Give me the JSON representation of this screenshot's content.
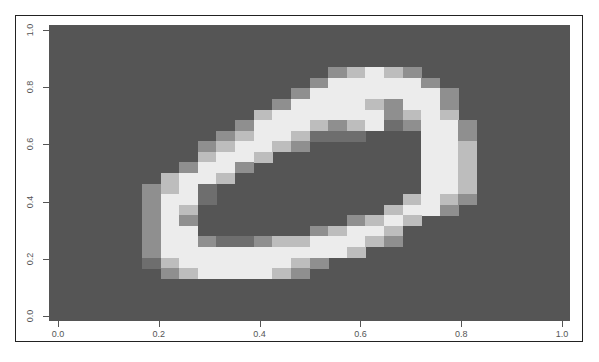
{
  "chart_data": {
    "type": "heatmap",
    "title": "",
    "xlabel": "",
    "ylabel": "",
    "xlim": [
      0,
      1
    ],
    "ylim": [
      0,
      1
    ],
    "x_ticks": [
      "0.0",
      "0.2",
      "0.4",
      "0.6",
      "0.8",
      "1.0"
    ],
    "y_ticks": [
      "0.0",
      "0.2",
      "0.4",
      "0.6",
      "0.8",
      "1.0"
    ],
    "grid": false,
    "legend": null,
    "grid_size": [
      28,
      28
    ],
    "palette": [
      "#555555",
      "#6e6e6e",
      "#8f8f8f",
      "#bdbdbd",
      "#ececec"
    ],
    "cells": [
      [
        4,
        15,
        2
      ],
      [
        4,
        16,
        3
      ],
      [
        4,
        17,
        4
      ],
      [
        4,
        18,
        3
      ],
      [
        4,
        19,
        2
      ],
      [
        5,
        14,
        2
      ],
      [
        5,
        15,
        4
      ],
      [
        5,
        16,
        4
      ],
      [
        5,
        17,
        4
      ],
      [
        5,
        18,
        4
      ],
      [
        5,
        19,
        4
      ],
      [
        5,
        20,
        2
      ],
      [
        6,
        13,
        2
      ],
      [
        6,
        14,
        4
      ],
      [
        6,
        15,
        4
      ],
      [
        6,
        16,
        4
      ],
      [
        6,
        17,
        4
      ],
      [
        6,
        18,
        4
      ],
      [
        6,
        19,
        4
      ],
      [
        6,
        20,
        4
      ],
      [
        6,
        21,
        2
      ],
      [
        7,
        12,
        2
      ],
      [
        7,
        13,
        4
      ],
      [
        7,
        14,
        4
      ],
      [
        7,
        15,
        4
      ],
      [
        7,
        16,
        4
      ],
      [
        7,
        17,
        3
      ],
      [
        7,
        18,
        2
      ],
      [
        7,
        19,
        4
      ],
      [
        7,
        20,
        4
      ],
      [
        7,
        21,
        2
      ],
      [
        8,
        11,
        3
      ],
      [
        8,
        12,
        4
      ],
      [
        8,
        13,
        4
      ],
      [
        8,
        14,
        4
      ],
      [
        8,
        15,
        4
      ],
      [
        8,
        16,
        4
      ],
      [
        8,
        17,
        4
      ],
      [
        8,
        18,
        2
      ],
      [
        8,
        19,
        3
      ],
      [
        8,
        20,
        4
      ],
      [
        8,
        21,
        3
      ],
      [
        9,
        10,
        2
      ],
      [
        9,
        11,
        4
      ],
      [
        9,
        12,
        4
      ],
      [
        9,
        13,
        4
      ],
      [
        9,
        14,
        3
      ],
      [
        9,
        15,
        2
      ],
      [
        9,
        16,
        3
      ],
      [
        9,
        17,
        4
      ],
      [
        9,
        18,
        1
      ],
      [
        9,
        19,
        2
      ],
      [
        9,
        20,
        4
      ],
      [
        9,
        21,
        4
      ],
      [
        9,
        22,
        2
      ],
      [
        10,
        9,
        2
      ],
      [
        10,
        10,
        3
      ],
      [
        10,
        11,
        4
      ],
      [
        10,
        12,
        4
      ],
      [
        10,
        13,
        3
      ],
      [
        10,
        14,
        1
      ],
      [
        10,
        15,
        1
      ],
      [
        10,
        16,
        1
      ],
      [
        10,
        20,
        4
      ],
      [
        10,
        21,
        4
      ],
      [
        10,
        22,
        2
      ],
      [
        11,
        8,
        2
      ],
      [
        11,
        9,
        3
      ],
      [
        11,
        10,
        4
      ],
      [
        11,
        11,
        4
      ],
      [
        11,
        12,
        3
      ],
      [
        11,
        13,
        2
      ],
      [
        11,
        20,
        4
      ],
      [
        11,
        21,
        4
      ],
      [
        11,
        22,
        3
      ],
      [
        12,
        8,
        3
      ],
      [
        12,
        9,
        4
      ],
      [
        12,
        10,
        4
      ],
      [
        12,
        11,
        3
      ],
      [
        12,
        20,
        4
      ],
      [
        12,
        21,
        4
      ],
      [
        12,
        22,
        3
      ],
      [
        13,
        7,
        2
      ],
      [
        13,
        8,
        4
      ],
      [
        13,
        9,
        4
      ],
      [
        13,
        10,
        2
      ],
      [
        13,
        20,
        4
      ],
      [
        13,
        21,
        4
      ],
      [
        13,
        22,
        3
      ],
      [
        14,
        6,
        3
      ],
      [
        14,
        7,
        4
      ],
      [
        14,
        8,
        4
      ],
      [
        14,
        9,
        3
      ],
      [
        14,
        20,
        4
      ],
      [
        14,
        21,
        4
      ],
      [
        14,
        22,
        3
      ],
      [
        15,
        5,
        2
      ],
      [
        15,
        6,
        3
      ],
      [
        15,
        7,
        4
      ],
      [
        15,
        8,
        1
      ],
      [
        15,
        20,
        4
      ],
      [
        15,
        21,
        4
      ],
      [
        15,
        22,
        3
      ],
      [
        16,
        5,
        2
      ],
      [
        16,
        6,
        4
      ],
      [
        16,
        7,
        4
      ],
      [
        16,
        8,
        1
      ],
      [
        16,
        19,
        3
      ],
      [
        16,
        20,
        4
      ],
      [
        16,
        21,
        3
      ],
      [
        16,
        22,
        2
      ],
      [
        17,
        5,
        2
      ],
      [
        17,
        6,
        4
      ],
      [
        17,
        7,
        3
      ],
      [
        17,
        18,
        3
      ],
      [
        17,
        19,
        4
      ],
      [
        17,
        20,
        4
      ],
      [
        17,
        21,
        2
      ],
      [
        18,
        5,
        2
      ],
      [
        18,
        6,
        4
      ],
      [
        18,
        7,
        2
      ],
      [
        18,
        16,
        2
      ],
      [
        18,
        17,
        3
      ],
      [
        18,
        18,
        4
      ],
      [
        18,
        19,
        3
      ],
      [
        19,
        5,
        2
      ],
      [
        19,
        6,
        4
      ],
      [
        19,
        7,
        4
      ],
      [
        19,
        14,
        2
      ],
      [
        19,
        15,
        3
      ],
      [
        19,
        16,
        4
      ],
      [
        19,
        17,
        4
      ],
      [
        19,
        18,
        3
      ],
      [
        20,
        5,
        2
      ],
      [
        20,
        6,
        4
      ],
      [
        20,
        7,
        4
      ],
      [
        20,
        8,
        2
      ],
      [
        20,
        9,
        1
      ],
      [
        20,
        10,
        1
      ],
      [
        20,
        11,
        2
      ],
      [
        20,
        12,
        3
      ],
      [
        20,
        13,
        3
      ],
      [
        20,
        14,
        4
      ],
      [
        20,
        15,
        4
      ],
      [
        20,
        16,
        4
      ],
      [
        20,
        17,
        3
      ],
      [
        20,
        18,
        2
      ],
      [
        21,
        5,
        2
      ],
      [
        21,
        6,
        4
      ],
      [
        21,
        7,
        4
      ],
      [
        21,
        8,
        4
      ],
      [
        21,
        9,
        4
      ],
      [
        21,
        10,
        4
      ],
      [
        21,
        11,
        4
      ],
      [
        21,
        12,
        4
      ],
      [
        21,
        13,
        4
      ],
      [
        21,
        14,
        4
      ],
      [
        21,
        15,
        4
      ],
      [
        21,
        16,
        3
      ],
      [
        22,
        5,
        1
      ],
      [
        22,
        6,
        3
      ],
      [
        22,
        7,
        4
      ],
      [
        22,
        8,
        4
      ],
      [
        22,
        9,
        4
      ],
      [
        22,
        10,
        4
      ],
      [
        22,
        11,
        4
      ],
      [
        22,
        12,
        4
      ],
      [
        22,
        13,
        3
      ],
      [
        22,
        14,
        2
      ],
      [
        23,
        6,
        2
      ],
      [
        23,
        7,
        3
      ],
      [
        23,
        8,
        4
      ],
      [
        23,
        9,
        4
      ],
      [
        23,
        10,
        4
      ],
      [
        23,
        11,
        4
      ],
      [
        23,
        12,
        3
      ],
      [
        23,
        13,
        2
      ]
    ]
  }
}
